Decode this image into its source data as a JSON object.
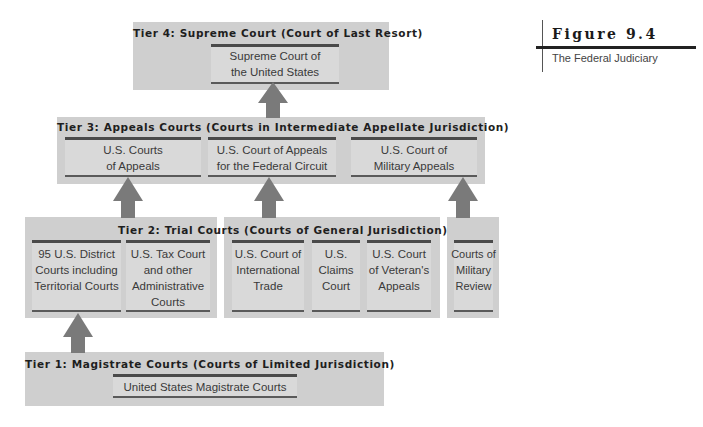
{
  "figure": {
    "title": "Figure 9.4",
    "subtitle": "The Federal Judiciary"
  },
  "tiers": {
    "tier4": {
      "title": "Tier 4: Supreme Court (Court of Last Resort)",
      "courts": [
        {
          "lines": [
            "Supreme Court of",
            "the United States"
          ]
        }
      ]
    },
    "tier3": {
      "title": "Tier 3: Appeals Courts (Courts in Intermediate Appellate Jurisdiction)",
      "courts": [
        {
          "lines": [
            "U.S. Courts",
            "of Appeals"
          ]
        },
        {
          "lines": [
            "U.S. Court of Appeals",
            "for the Federal Circuit"
          ]
        },
        {
          "lines": [
            "U.S. Court of",
            "Military Appeals"
          ]
        }
      ]
    },
    "tier2": {
      "title": "Tier 2: Trial Courts (Courts of General Jurisdiction)",
      "courts": [
        {
          "lines": [
            "95 U.S. District",
            "Courts including",
            "Territorial Courts"
          ]
        },
        {
          "lines": [
            "U.S. Tax Court",
            "and other",
            "Administrative",
            "Courts"
          ]
        },
        {
          "lines": [
            "U.S. Court of",
            "International",
            "Trade"
          ]
        },
        {
          "lines": [
            "U.S.",
            "Claims",
            "Court"
          ]
        },
        {
          "lines": [
            "U.S. Court",
            "of Veteran's",
            "Appeals"
          ]
        },
        {
          "lines": [
            "Courts of",
            "Military",
            "Review"
          ]
        }
      ]
    },
    "tier1": {
      "title": "Tier 1: Magistrate Courts (Courts of Limited Jurisdiction)",
      "courts": [
        {
          "lines": [
            "United States Magistrate Courts"
          ]
        }
      ]
    }
  },
  "arrows": [
    {
      "from": "Tier 1: United States Magistrate Courts",
      "to": "95 U.S. District Courts"
    },
    {
      "from": "95 U.S. District Courts",
      "to": "U.S. Courts of Appeals"
    },
    {
      "from": "U.S. Court of International Trade",
      "to": "U.S. Court of Appeals for the Federal Circuit"
    },
    {
      "from": "Courts of Military Review",
      "to": "U.S. Court of Military Appeals"
    },
    {
      "from": "Tier 3",
      "to": "Supreme Court of the United States"
    }
  ],
  "colors": {
    "tier_bg": "#cfcfcf",
    "court_bg": "#d9d9d9",
    "arrow": "#7a7a7a",
    "rule": "#4a4a4a"
  }
}
